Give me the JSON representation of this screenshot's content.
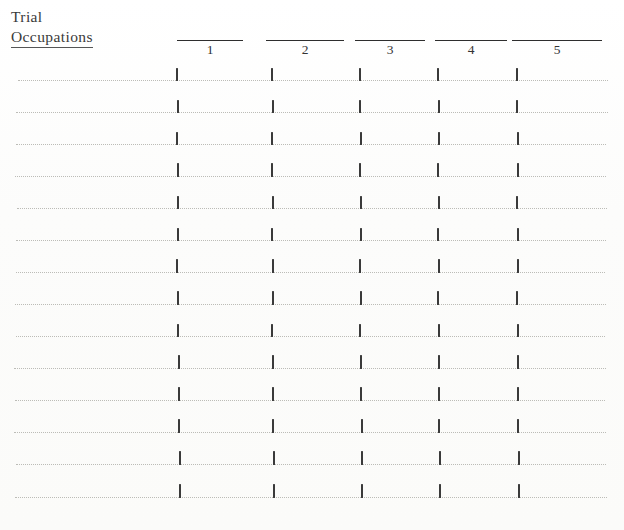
{
  "page": {
    "background_color": "#fdfdfc",
    "ink_color": "#2e2e2e",
    "rule_color": "#b9b9b4",
    "width": 624,
    "height": 530
  },
  "title": {
    "line1": "Trial",
    "line2": "Occupations",
    "line2_underlined": true
  },
  "columns": [
    {
      "label": "1",
      "rule_left": 177,
      "rule_width": 66,
      "center": 211,
      "tick_x": 176
    },
    {
      "label": "2",
      "rule_left": 266,
      "rule_width": 78,
      "center": 304,
      "tick_x": 271
    },
    {
      "label": "3",
      "rule_left": 355,
      "rule_width": 70,
      "center": 387,
      "tick_x": 359
    },
    {
      "label": "4",
      "rule_left": 435,
      "rule_width": 72,
      "center": 470,
      "tick_x": 437
    },
    {
      "label": "5",
      "rule_left": 512,
      "rule_width": 90,
      "center": 548,
      "tick_x": 516
    }
  ],
  "header_geometry": {
    "rule_y": 40,
    "number_y": 43
  },
  "rows": [
    {
      "index": 1,
      "y": 80,
      "line_left": 18,
      "line_right": 608,
      "tick_h": 13,
      "tick_dx": [
        0,
        0,
        0,
        0,
        0
      ]
    },
    {
      "index": 2,
      "y": 112,
      "line_left": 16,
      "line_right": 608,
      "tick_h": 13,
      "tick_dx": [
        1,
        1,
        0,
        1,
        0
      ]
    },
    {
      "index": 3,
      "y": 144,
      "line_left": 16,
      "line_right": 606,
      "tick_h": 13,
      "tick_dx": [
        0,
        0,
        1,
        1,
        1
      ]
    },
    {
      "index": 4,
      "y": 176,
      "line_left": 15,
      "line_right": 606,
      "tick_h": 14,
      "tick_dx": [
        1,
        0,
        0,
        0,
        1
      ]
    },
    {
      "index": 5,
      "y": 208,
      "line_left": 17,
      "line_right": 607,
      "tick_h": 13,
      "tick_dx": [
        1,
        1,
        1,
        1,
        0
      ]
    },
    {
      "index": 6,
      "y": 240,
      "line_left": 16,
      "line_right": 606,
      "tick_h": 13,
      "tick_dx": [
        1,
        0,
        1,
        0,
        1
      ]
    },
    {
      "index": 7,
      "y": 272,
      "line_left": 16,
      "line_right": 605,
      "tick_h": 14,
      "tick_dx": [
        0,
        1,
        0,
        1,
        1
      ]
    },
    {
      "index": 8,
      "y": 304,
      "line_left": 15,
      "line_right": 606,
      "tick_h": 14,
      "tick_dx": [
        1,
        1,
        1,
        0,
        0
      ]
    },
    {
      "index": 9,
      "y": 336,
      "line_left": 16,
      "line_right": 605,
      "tick_h": 13,
      "tick_dx": [
        1,
        0,
        0,
        1,
        1
      ]
    },
    {
      "index": 10,
      "y": 368,
      "line_left": 14,
      "line_right": 606,
      "tick_h": 14,
      "tick_dx": [
        2,
        1,
        1,
        1,
        1
      ]
    },
    {
      "index": 11,
      "y": 400,
      "line_left": 15,
      "line_right": 605,
      "tick_h": 14,
      "tick_dx": [
        2,
        1,
        1,
        1,
        1
      ]
    },
    {
      "index": 12,
      "y": 432,
      "line_left": 14,
      "line_right": 606,
      "tick_h": 14,
      "tick_dx": [
        2,
        1,
        2,
        1,
        1
      ]
    },
    {
      "index": 13,
      "y": 464,
      "line_left": 16,
      "line_right": 606,
      "tick_h": 14,
      "tick_dx": [
        3,
        2,
        2,
        2,
        2
      ]
    },
    {
      "index": 14,
      "y": 497,
      "line_left": 15,
      "line_right": 607,
      "tick_h": 14,
      "tick_dx": [
        3,
        2,
        2,
        2,
        2
      ]
    }
  ]
}
